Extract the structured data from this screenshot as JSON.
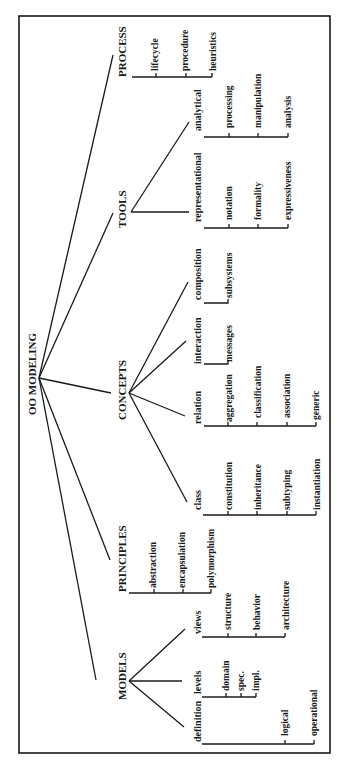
{
  "title": "OO MODELING",
  "colors": {
    "ink": "#1a1a1a",
    "background": "#ffffff"
  },
  "frame": {
    "x": 19,
    "y": 16,
    "w": 311,
    "h": 737
  },
  "root": {
    "label": "OO MODELING",
    "x": 33,
    "y": 374,
    "apex": [
      39,
      378
    ]
  },
  "nodes": [
    {
      "id": "process",
      "label": "PROCESS",
      "level": "top",
      "x": 126,
      "y": 77,
      "edge_to": [
        113,
        55
      ],
      "bracket": {
        "x": 132,
        "y1": 77,
        "y2": 212,
        "ticks": [
          156,
          186,
          212
        ]
      },
      "children": [
        {
          "label": "lifecycle",
          "x": 155,
          "y": 74
        },
        {
          "label": "procedure",
          "x": 185,
          "y": 74
        },
        {
          "label": "heuristics",
          "x": 213,
          "y": 74
        }
      ]
    },
    {
      "id": "tools",
      "label": "TOOLS",
      "level": "top",
      "x": 126,
      "y": 225,
      "edge_to": [
        113,
        213
      ],
      "apex": [
        131,
        212
      ],
      "subs": [
        {
          "label": "analytical",
          "x": 201,
          "y": 128,
          "edge_from": [
            131,
            212
          ],
          "edge_to": [
            189,
            122
          ],
          "bracket": {
            "x": 204,
            "y1": 137,
            "y2": 290,
            "ticks": [
              229,
              258,
              287
            ]
          },
          "children": [
            {
              "label": "processing",
              "x": 229,
              "y": 126
            },
            {
              "label": "manipulation",
              "x": 258,
              "y": 126
            },
            {
              "label": "analysis",
              "x": 287,
              "y": 126
            }
          ]
        },
        {
          "label": "representational",
          "x": 200,
          "y": 218,
          "edge_from": [
            131,
            212
          ],
          "edge_to": [
            189,
            212
          ],
          "bracket": {
            "x": 204,
            "y1": 228,
            "y2": 290,
            "ticks": [
              229,
              258,
              287
            ]
          },
          "children": [
            {
              "label": "notation",
              "x": 229,
              "y": 220
            },
            {
              "label": "formality",
              "x": 258,
              "y": 220
            },
            {
              "label": "expressiveness",
              "x": 287,
              "y": 220
            }
          ]
        }
      ]
    },
    {
      "id": "concepts",
      "label": "CONCEPTS",
      "level": "top",
      "x": 126,
      "y": 420,
      "edge_to": [
        111,
        393
      ],
      "apex": [
        129,
        393
      ],
      "subs": [
        {
          "label": "composition",
          "x": 199,
          "y": 300,
          "edge_from": [
            129,
            393
          ],
          "edge_to": [
            188,
            282
          ],
          "bracket": {
            "x": 204,
            "y1": 303,
            "y2": 303,
            "ticks": [
              228
            ]
          },
          "children": [
            {
              "label": "subsystems",
              "x": 229,
              "y": 298
            }
          ]
        },
        {
          "label": "interaction",
          "x": 199,
          "y": 364,
          "edge_from": [
            129,
            393
          ],
          "edge_to": [
            186,
            341
          ],
          "bracket": {
            "x": 204,
            "y1": 364,
            "y2": 364,
            "ticks": [
              228
            ]
          },
          "children": [
            {
              "label": "messages",
              "x": 229,
              "y": 362
            }
          ]
        },
        {
          "label": "relation",
          "x": 199,
          "y": 423,
          "edge_from": [
            129,
            393
          ],
          "edge_to": [
            185,
            416
          ],
          "bracket": {
            "x": 204,
            "y1": 426,
            "y2": 426,
            "ticks": [
              228,
              257,
              287,
              316
            ]
          },
          "children": [
            {
              "label": "aggregation",
              "x": 229,
              "y": 423
            },
            {
              "label": "classification",
              "x": 258,
              "y": 418
            },
            {
              "label": "association",
              "x": 288,
              "y": 418
            },
            {
              "label": "generic",
              "x": 317,
              "y": 420
            }
          ]
        },
        {
          "label": "class",
          "x": 199,
          "y": 505,
          "edge_from": [
            129,
            393
          ],
          "edge_to": [
            187,
            502
          ],
          "bracket": {
            "x": 204,
            "y1": 515,
            "y2": 515,
            "ticks": [
              228,
              257,
              287,
              316
            ]
          },
          "children": [
            {
              "label": "constitution",
              "x": 229,
              "y": 510
            },
            {
              "label": "inheritance",
              "x": 259,
              "y": 510
            },
            {
              "label": "subtyping",
              "x": 288,
              "y": 510
            },
            {
              "label": "instantiation",
              "x": 318,
              "y": 510
            }
          ]
        }
      ]
    },
    {
      "id": "principles",
      "label": "PRINCIPLES",
      "level": "top",
      "x": 126,
      "y": 593,
      "edge_to": [
        110,
        560
      ],
      "bracket": {
        "x": 130,
        "y1": 593,
        "y2": 593,
        "ticks": [
          154,
          183,
          212
        ]
      },
      "children": [
        {
          "label": "abstraction",
          "x": 155,
          "y": 590
        },
        {
          "label": "encapsulation",
          "x": 184,
          "y": 590
        },
        {
          "label": "polymorphism",
          "x": 213,
          "y": 590
        }
      ]
    },
    {
      "id": "models",
      "label": "MODELS",
      "level": "top",
      "x": 126,
      "y": 700,
      "edge_to": [
        110,
        680
      ],
      "apex": [
        129,
        681
      ],
      "subs": [
        {
          "label": "views",
          "x": 199,
          "y": 635,
          "edge_from": [
            129,
            681
          ],
          "edge_to": [
            185,
            629
          ],
          "bracket": {
            "x": 204,
            "y1": 637,
            "y2": 637,
            "ticks": [
              228,
              257,
              285
            ]
          },
          "children": [
            {
              "label": "structure",
              "x": 229,
              "y": 632
            },
            {
              "label": "behavior",
              "x": 258,
              "y": 632
            },
            {
              "label": "architecture",
              "x": 287,
              "y": 632
            }
          ]
        },
        {
          "label": "levels",
          "x": 199,
          "y": 695,
          "edge_from": [
            129,
            681
          ],
          "edge_to": [
            182,
            681
          ],
          "bracket": {
            "x": 204,
            "y1": 697,
            "y2": 697,
            "ticks": [
              227,
              241,
              256
            ]
          },
          "children": [
            {
              "label": "domain",
              "x": 227,
              "y": 692
            },
            {
              "label": "spec.",
              "x": 243,
              "y": 682
            },
            {
              "label": "impl.",
              "x": 257,
              "y": 683
            }
          ]
        },
        {
          "label": "definition",
          "x": 199,
          "y": 745,
          "edge_from": [
            129,
            681
          ],
          "edge_to": [
            184,
            728
          ],
          "bracket": {
            "x": 204,
            "y1": 745,
            "y2": 745,
            "ticks": [
              285,
              314
            ]
          },
          "children": [
            {
              "label": "logical",
              "x": 287,
              "y": 736
            },
            {
              "label": "operational",
              "x": 316,
              "y": 735
            }
          ]
        }
      ]
    }
  ]
}
